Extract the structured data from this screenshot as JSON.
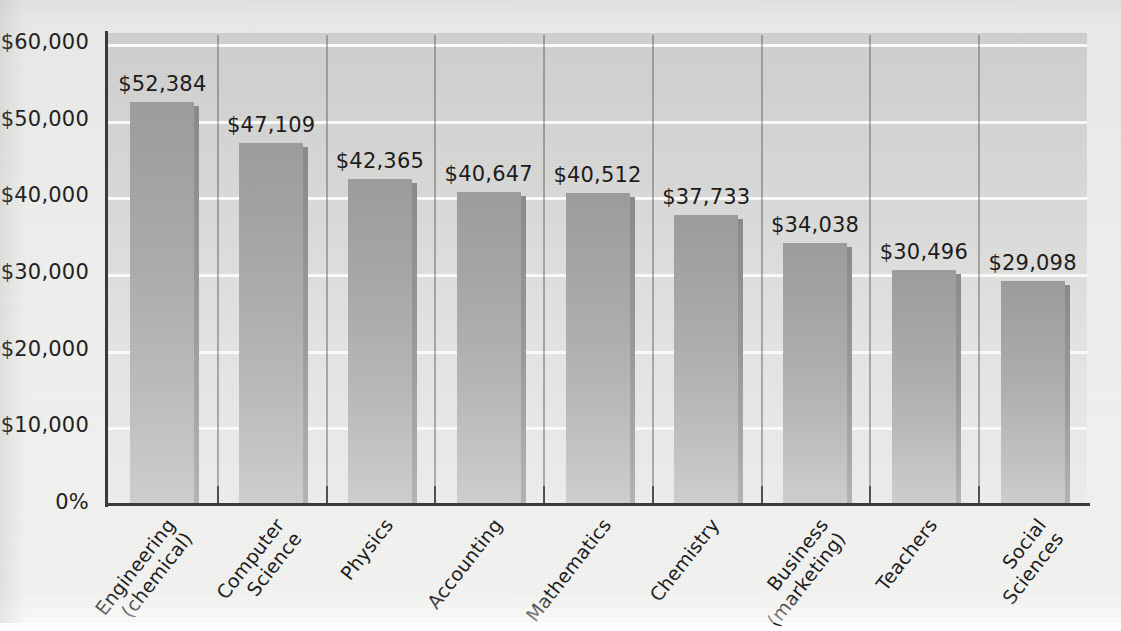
{
  "chart_data": {
    "type": "bar",
    "title": "",
    "subtitle": "",
    "xlabel": "",
    "ylabel": "",
    "categories": [
      "Engineering (chemical)",
      "Computer Science",
      "Physics",
      "Accounting",
      "Mathematics",
      "Chemistry",
      "Business (marketing)",
      "Teachers",
      "Social Sciences"
    ],
    "category_lines": [
      [
        "Engineering",
        "(chemical)"
      ],
      [
        "Computer",
        "Science"
      ],
      [
        "Physics",
        ""
      ],
      [
        "Accounting",
        ""
      ],
      [
        "Mathematics",
        ""
      ],
      [
        "Chemistry",
        ""
      ],
      [
        "Business",
        "(marketing)"
      ],
      [
        "Teachers",
        ""
      ],
      [
        "Social",
        "Sciences"
      ]
    ],
    "values": [
      52384,
      47109,
      42365,
      40647,
      40512,
      37733,
      34038,
      30496,
      29098
    ],
    "value_labels": [
      "$52,384",
      "$47,109",
      "$42,365",
      "$40,647",
      "$40,512",
      "$37,733",
      "$34,038",
      "$30,496",
      "$29,098"
    ],
    "ylim": [
      0,
      60000
    ],
    "ytick_values": [
      60000,
      50000,
      40000,
      30000,
      20000,
      10000,
      0
    ],
    "ytick_labels": [
      "$60,000",
      "$50,000",
      "$40,000",
      "$30,000",
      "$20,000",
      "$10,000",
      "0%"
    ],
    "grid": true,
    "gridline_color": "#fbfbfa",
    "legend": "none",
    "bar_color": "#aeaeac",
    "bar_shadow_color": "#8b8b89",
    "plot_background": "#d7d7d5",
    "axis_color": "#3b3b3b",
    "text_color": "#1c1c1c"
  }
}
